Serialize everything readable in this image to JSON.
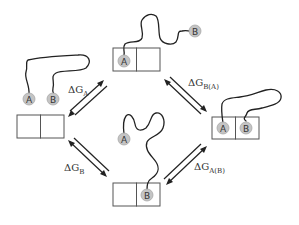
{
  "states": [
    {
      "id": "left",
      "description": "unbound: A and B free",
      "beads": [
        "A",
        "B"
      ],
      "bound": []
    },
    {
      "id": "top",
      "description": "A bound to left site",
      "beads": [
        "A",
        "B"
      ],
      "bound": [
        "A"
      ]
    },
    {
      "id": "bottom",
      "description": "B bound to right site",
      "beads": [
        "A",
        "B"
      ],
      "bound": [
        "B"
      ]
    },
    {
      "id": "right",
      "description": "A and B both bound",
      "beads": [
        "A",
        "B"
      ],
      "bound": [
        "A",
        "B"
      ]
    }
  ],
  "beads": {
    "A": "A",
    "B": "B"
  },
  "labels": {
    "dGA": {
      "delta": "ΔG",
      "sub": "A"
    },
    "dGB": {
      "delta": "ΔG",
      "sub": "B"
    },
    "dGBA": {
      "delta": "ΔG",
      "sub": "B(A)"
    },
    "dGAB": {
      "delta": "ΔG",
      "sub": "A(B)"
    }
  },
  "colors": {
    "bead_fill": "#c4c4c4",
    "line": "#222222",
    "box_stroke": "#555555",
    "text": "#333333"
  }
}
